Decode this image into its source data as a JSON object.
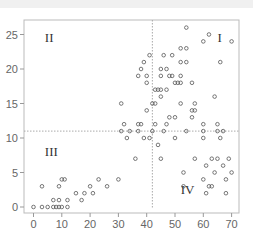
{
  "chart_data": {
    "type": "scatter",
    "title": "",
    "xlabel": "",
    "ylabel": "",
    "xlim": [
      -3,
      72
    ],
    "ylim": [
      -1,
      27
    ],
    "xticks": [
      0,
      10,
      20,
      30,
      40,
      50,
      60,
      70
    ],
    "yticks": [
      0,
      5,
      10,
      15,
      20,
      25
    ],
    "xtick_labels": [
      "0",
      "10",
      "20",
      "30",
      "40",
      "50",
      "60",
      "70"
    ],
    "ytick_labels": [
      "0",
      "5",
      "10",
      "15",
      "20",
      "25"
    ],
    "grid": false,
    "legend": null,
    "reference_lines": {
      "vertical_x": 42,
      "horizontal_y": 11,
      "style": "dotted"
    },
    "quadrant_labels": [
      {
        "text": "I",
        "x": 65,
        "y": 24.5
      },
      {
        "text": "II",
        "x": 4,
        "y": 24.5
      },
      {
        "text": "III",
        "x": 4,
        "y": 8
      },
      {
        "text": "IV",
        "x": 52,
        "y": 2.5
      }
    ],
    "marker": "open-circle",
    "marker_color": "#555555",
    "points": [
      [
        0,
        0
      ],
      [
        3,
        0
      ],
      [
        5,
        0
      ],
      [
        7,
        0
      ],
      [
        8,
        0
      ],
      [
        9,
        0
      ],
      [
        10,
        0
      ],
      [
        12,
        0
      ],
      [
        7,
        1
      ],
      [
        9,
        1
      ],
      [
        12,
        1
      ],
      [
        17,
        1
      ],
      [
        15,
        2
      ],
      [
        18,
        2
      ],
      [
        21,
        2
      ],
      [
        3,
        3
      ],
      [
        9,
        3
      ],
      [
        20,
        3
      ],
      [
        26,
        3
      ],
      [
        10,
        4
      ],
      [
        11,
        4
      ],
      [
        23,
        4
      ],
      [
        30,
        4
      ],
      [
        36,
        7
      ],
      [
        45,
        7
      ],
      [
        57,
        7
      ],
      [
        63,
        7
      ],
      [
        65,
        7
      ],
      [
        69,
        7
      ],
      [
        53,
        5
      ],
      [
        64,
        5
      ],
      [
        70,
        5
      ],
      [
        61,
        6
      ],
      [
        67,
        6
      ],
      [
        68,
        4
      ],
      [
        60,
        4
      ],
      [
        53,
        3
      ],
      [
        62,
        3
      ],
      [
        63,
        3
      ],
      [
        61,
        2
      ],
      [
        68,
        2
      ],
      [
        31,
        11
      ],
      [
        34,
        11
      ],
      [
        37,
        11
      ],
      [
        42,
        11
      ],
      [
        46,
        11
      ],
      [
        54,
        11
      ],
      [
        60,
        11
      ],
      [
        65,
        11
      ],
      [
        67,
        11
      ],
      [
        32,
        12
      ],
      [
        37,
        12
      ],
      [
        38,
        12
      ],
      [
        43,
        12
      ],
      [
        47,
        12
      ],
      [
        60,
        12
      ],
      [
        65,
        12
      ],
      [
        33,
        10
      ],
      [
        39,
        10
      ],
      [
        41,
        10
      ],
      [
        44,
        9
      ],
      [
        50,
        10
      ],
      [
        60,
        10
      ],
      [
        66,
        10
      ],
      [
        31,
        15
      ],
      [
        42,
        15
      ],
      [
        43,
        15
      ],
      [
        52,
        15
      ],
      [
        57,
        15
      ],
      [
        40,
        14
      ],
      [
        56,
        14
      ],
      [
        57,
        14
      ],
      [
        48,
        13
      ],
      [
        50,
        13
      ],
      [
        56,
        13
      ],
      [
        45,
        16
      ],
      [
        64,
        16
      ],
      [
        43,
        17
      ],
      [
        44,
        17
      ],
      [
        45,
        17
      ],
      [
        47,
        17
      ],
      [
        40,
        18
      ],
      [
        50,
        18
      ],
      [
        51,
        18
      ],
      [
        52,
        18
      ],
      [
        56,
        18
      ],
      [
        37,
        19
      ],
      [
        40,
        19
      ],
      [
        45,
        19
      ],
      [
        48,
        19
      ],
      [
        49,
        19
      ],
      [
        52,
        19
      ],
      [
        38,
        20
      ],
      [
        45,
        20
      ],
      [
        47,
        20
      ],
      [
        39,
        21
      ],
      [
        52,
        21
      ],
      [
        54,
        21
      ],
      [
        66,
        21
      ],
      [
        41,
        22
      ],
      [
        46,
        22
      ],
      [
        49,
        22
      ],
      [
        52,
        23
      ],
      [
        54,
        23
      ],
      [
        60,
        24
      ],
      [
        70,
        24
      ],
      [
        62,
        25
      ],
      [
        54,
        26
      ]
    ]
  }
}
